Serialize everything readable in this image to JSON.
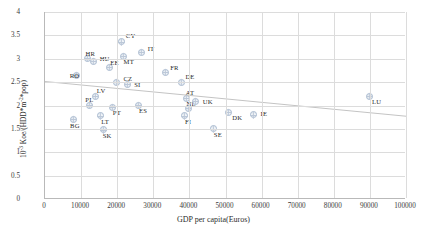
{
  "chart_data": {
    "type": "scatter",
    "title": "",
    "xlabel": "GDP per capita(Euros)",
    "ylabel_html": "10<sup>-3</sup> Koe/(HDD*m<sup>-2</sup>*pop)",
    "ylabel_text": "10-3 Koe/(HDD*m-2*pop)",
    "xlim": [
      0,
      100000
    ],
    "ylim": [
      0,
      4
    ],
    "xticks": [
      0,
      10000,
      20000,
      30000,
      40000,
      50000,
      60000,
      70000,
      80000,
      90000,
      100000
    ],
    "yticks": [
      0,
      0.5,
      1,
      1.5,
      2,
      2.5,
      3,
      3.5,
      4
    ],
    "grid": true,
    "legend": "none",
    "marker_color": "#b8c6d8",
    "trend_color": "#c4c4c4",
    "trendline": {
      "x0": 0,
      "y0": 2.52,
      "x1": 100000,
      "y1": 1.78
    },
    "points": [
      {
        "label": "BG",
        "x": 7500,
        "y": 1.72,
        "lx": -5,
        "ly": 7
      },
      {
        "label": "RO",
        "x": 8500,
        "y": 2.67,
        "lx": -9,
        "ly": 2
      },
      {
        "label": "HR",
        "x": 11500,
        "y": 3.02,
        "lx": -4,
        "ly": -4
      },
      {
        "label": "PL",
        "x": 12000,
        "y": 2.03,
        "lx": -6,
        "ly": -4
      },
      {
        "label": "LV",
        "x": 13800,
        "y": 2.22,
        "lx": -1,
        "ly": -4
      },
      {
        "label": "HU",
        "x": 13200,
        "y": 2.97,
        "lx": 4,
        "ly": -1
      },
      {
        "label": "LT",
        "x": 15000,
        "y": 1.8,
        "lx": -1,
        "ly": 7
      },
      {
        "label": "SK",
        "x": 16000,
        "y": 1.5,
        "lx": -3,
        "ly": 7
      },
      {
        "label": "EE",
        "x": 17500,
        "y": 2.83,
        "lx": -1,
        "ly": -4
      },
      {
        "label": "PT",
        "x": 18500,
        "y": 1.98,
        "lx": -2,
        "ly": 7
      },
      {
        "label": "CZ",
        "x": 19500,
        "y": 2.52,
        "lx": 5,
        "ly": -2
      },
      {
        "label": "CY",
        "x": 21000,
        "y": 3.38,
        "lx": 2,
        "ly": -5
      },
      {
        "label": "MT",
        "x": 21500,
        "y": 3.08,
        "lx": -2,
        "ly": 7
      },
      {
        "label": "SI",
        "x": 22500,
        "y": 2.47,
        "lx": 5,
        "ly": 1
      },
      {
        "label": "ES",
        "x": 25500,
        "y": 2.03,
        "lx": -1,
        "ly": 7
      },
      {
        "label": "IT",
        "x": 26500,
        "y": 3.15,
        "lx": 4,
        "ly": -3
      },
      {
        "label": "FR",
        "x": 33000,
        "y": 2.72,
        "lx": 3,
        "ly": -4
      },
      {
        "label": "DE",
        "x": 37500,
        "y": 2.52,
        "lx": 2,
        "ly": -4
      },
      {
        "label": "NL",
        "x": 39500,
        "y": 1.95,
        "lx": -4,
        "ly": -4
      },
      {
        "label": "FI",
        "x": 38500,
        "y": 1.8,
        "lx": -2,
        "ly": 7
      },
      {
        "label": "AT",
        "x": 39000,
        "y": 2.18,
        "lx": -3,
        "ly": -4
      },
      {
        "label": "UK",
        "x": 41500,
        "y": 2.1,
        "lx": 5,
        "ly": 1
      },
      {
        "label": "SE",
        "x": 46500,
        "y": 1.52,
        "lx": -2,
        "ly": 7
      },
      {
        "label": "DK",
        "x": 50500,
        "y": 1.88,
        "lx": 2,
        "ly": 7
      },
      {
        "label": "IE",
        "x": 57500,
        "y": 1.82,
        "lx": 5,
        "ly": 0
      },
      {
        "label": "LU",
        "x": 89500,
        "y": 2.22,
        "lx": 1,
        "ly": 7
      }
    ]
  },
  "caption": ""
}
